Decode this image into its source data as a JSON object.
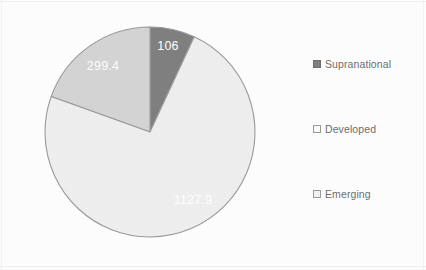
{
  "chart_data": {
    "type": "pie",
    "title": "",
    "subtitle": "",
    "xlabel": "",
    "ylabel": "",
    "grid": false,
    "legend_position": "right",
    "total": 1533.3,
    "start_angle_deg": 0,
    "direction": "clockwise",
    "categories": [
      "Supranational",
      "Developed",
      "Emerging"
    ],
    "values": [
      106,
      299.4,
      1127.9
    ],
    "labels": [
      "106",
      "299.4",
      "1127.9"
    ],
    "colors": [
      "#808080",
      "#d4d4d4",
      "#efefef"
    ],
    "slices": [
      {
        "name": "Supranational",
        "value": 106,
        "label": "106",
        "color": "#808080",
        "label_color": "#ffffff",
        "start_deg": 0,
        "sweep_deg": 24.9,
        "label_x": 168,
        "label_y": 47
      },
      {
        "name": "Developed",
        "value": 299.4,
        "label": "299.4",
        "color": "#d4d4d4",
        "label_color": "#ffffff",
        "start_deg": 289.7,
        "sweep_deg": 70.3,
        "label_x": 103,
        "label_y": 67
      },
      {
        "name": "Emerging",
        "value": 1127.9,
        "label": "1127.9",
        "color": "#efefef",
        "label_color": "#ffffff",
        "start_deg": 24.9,
        "sweep_deg": 264.8,
        "label_x": 193,
        "label_y": 201
      }
    ],
    "geometry": {
      "center_x": 150,
      "center_y": 132,
      "radius": 105,
      "outline_color": "#9a9a9a"
    }
  },
  "legend": {
    "items": [
      {
        "label": "Supranational",
        "swatch_color": "#808080",
        "swatch_border": "#6f6f6f"
      },
      {
        "label": "Developed",
        "swatch_color": "#fafafa",
        "swatch_border": "#9b9b9b"
      },
      {
        "label": "Emerging",
        "swatch_color": "#f2f2f2",
        "swatch_border": "#9b9b9b"
      }
    ]
  }
}
